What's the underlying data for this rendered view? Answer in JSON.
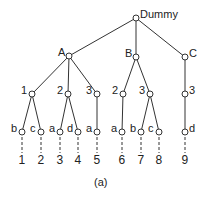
{
  "diagram": {
    "caption": "(a)",
    "nodes": [
      {
        "id": "root",
        "label": "Dummy",
        "x": 136,
        "y": 18,
        "label_side": "right"
      },
      {
        "id": "A",
        "label": "A",
        "x": 69,
        "y": 56,
        "label_side": "left"
      },
      {
        "id": "B",
        "label": "B",
        "x": 136,
        "y": 57,
        "label_side": "left"
      },
      {
        "id": "C",
        "label": "C",
        "x": 185,
        "y": 57,
        "label_side": "right"
      },
      {
        "id": "A1",
        "label": "1",
        "x": 32,
        "y": 94,
        "label_side": "left"
      },
      {
        "id": "A2",
        "label": "2",
        "x": 68,
        "y": 94,
        "label_side": "left"
      },
      {
        "id": "A3",
        "label": "3",
        "x": 97,
        "y": 94,
        "label_side": "left"
      },
      {
        "id": "B2",
        "label": "2",
        "x": 123,
        "y": 94,
        "label_side": "left"
      },
      {
        "id": "B3",
        "label": "3",
        "x": 150,
        "y": 94,
        "label_side": "left"
      },
      {
        "id": "C3",
        "label": "3",
        "x": 185,
        "y": 94,
        "label_side": "right"
      },
      {
        "id": "A1b",
        "label": "b",
        "x": 22,
        "y": 132,
        "label_side": "left"
      },
      {
        "id": "A1c",
        "label": "c",
        "x": 41,
        "y": 132,
        "label_side": "left"
      },
      {
        "id": "A2a",
        "label": "a",
        "x": 60,
        "y": 132,
        "label_side": "left"
      },
      {
        "id": "A2d",
        "label": "d",
        "x": 78,
        "y": 132,
        "label_side": "left"
      },
      {
        "id": "A3a",
        "label": "a",
        "x": 97,
        "y": 132,
        "label_side": "left"
      },
      {
        "id": "B2a",
        "label": "a",
        "x": 122,
        "y": 132,
        "label_side": "left"
      },
      {
        "id": "B3b",
        "label": "b",
        "x": 141,
        "y": 132,
        "label_side": "left"
      },
      {
        "id": "B3c",
        "label": "c",
        "x": 159,
        "y": 132,
        "label_side": "left"
      },
      {
        "id": "C3d",
        "label": "d",
        "x": 185,
        "y": 132,
        "label_side": "right"
      }
    ],
    "edges": [
      [
        "root",
        "A"
      ],
      [
        "root",
        "B"
      ],
      [
        "root",
        "C"
      ],
      [
        "A",
        "A1"
      ],
      [
        "A",
        "A2"
      ],
      [
        "A",
        "A3"
      ],
      [
        "B",
        "B2"
      ],
      [
        "B",
        "B3"
      ],
      [
        "C",
        "C3"
      ],
      [
        "A1",
        "A1b"
      ],
      [
        "A1",
        "A1c"
      ],
      [
        "A2",
        "A2a"
      ],
      [
        "A2",
        "A2d"
      ],
      [
        "A3",
        "A3a"
      ],
      [
        "B2",
        "B2a"
      ],
      [
        "B3",
        "B3b"
      ],
      [
        "B3",
        "B3c"
      ],
      [
        "C3",
        "C3d"
      ]
    ],
    "leaves": [
      {
        "from": "A1b",
        "label": "1",
        "x": 22
      },
      {
        "from": "A1c",
        "label": "2",
        "x": 41
      },
      {
        "from": "A2a",
        "label": "3",
        "x": 60
      },
      {
        "from": "A2d",
        "label": "4",
        "x": 78
      },
      {
        "from": "A3a",
        "label": "5",
        "x": 97
      },
      {
        "from": "B2a",
        "label": "6",
        "x": 122
      },
      {
        "from": "B3b",
        "label": "7",
        "x": 141
      },
      {
        "from": "B3c",
        "label": "8",
        "x": 159
      },
      {
        "from": "C3d",
        "label": "9",
        "x": 185
      }
    ],
    "leaf_number_y": 160,
    "caption_pos": {
      "x": 103,
      "y": 183
    }
  }
}
